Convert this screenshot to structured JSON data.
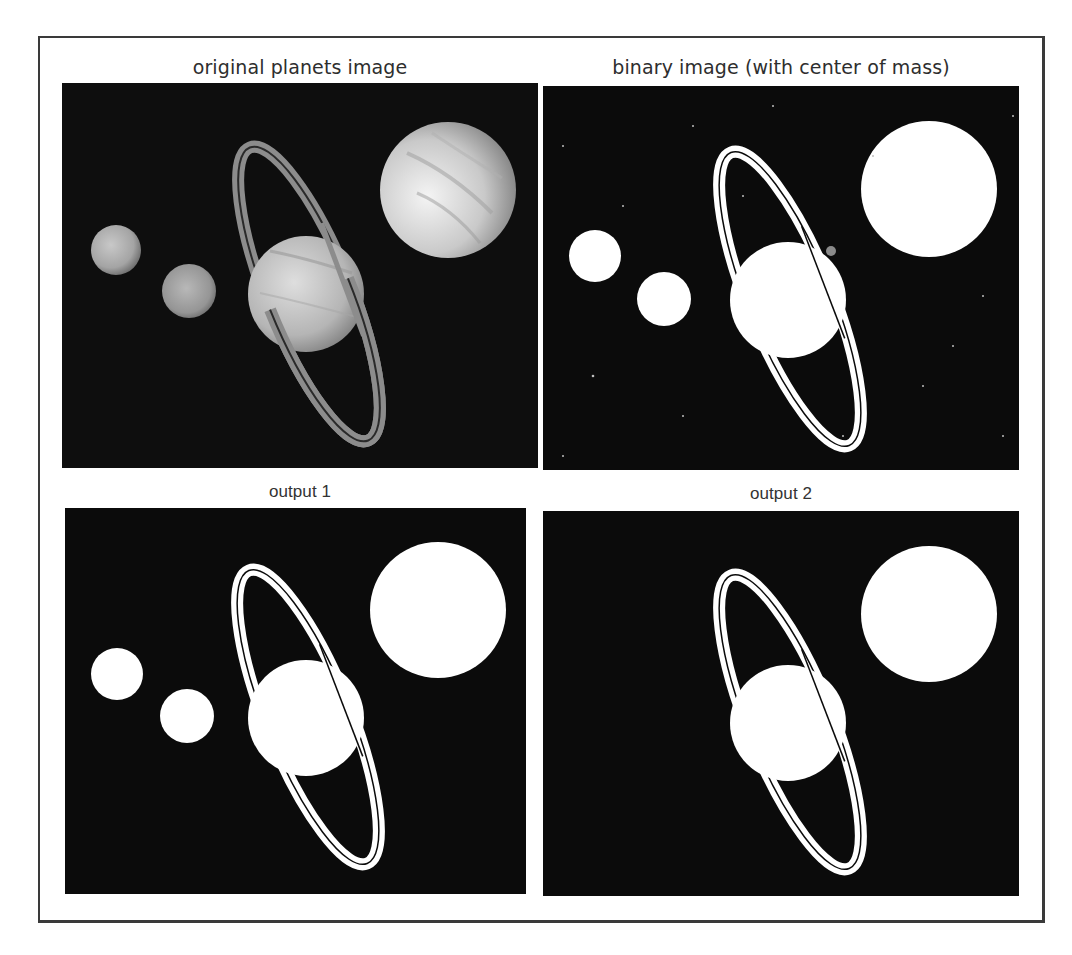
{
  "figure": {
    "panels": [
      {
        "id": "original",
        "title": "original planets image",
        "kind": "grayscale",
        "bodies": [
          "small-moon-left",
          "small-moon-middle",
          "saturn-with-rings",
          "jupiter"
        ]
      },
      {
        "id": "binary",
        "title": "binary image (with center of mass)",
        "kind": "binary",
        "center_of_mass_marker": "gray dot near upper-right edge of Saturn",
        "bodies": [
          "small-moon-left",
          "small-moon-middle",
          "saturn-with-rings",
          "jupiter"
        ]
      },
      {
        "id": "output1",
        "title": "output 1",
        "kind": "binary",
        "bodies": [
          "small-moon-left",
          "small-moon-middle",
          "saturn-with-rings",
          "jupiter"
        ]
      },
      {
        "id": "output2",
        "title": "output 2",
        "kind": "binary",
        "bodies": [
          "saturn-with-rings",
          "jupiter"
        ]
      }
    ],
    "colors": {
      "background": "#0b0b0b",
      "foreground": "#ffffff",
      "frame": "#3a3a3a",
      "title_text": "#2e2e2e",
      "center_of_mass": "#8a8a8a"
    }
  }
}
